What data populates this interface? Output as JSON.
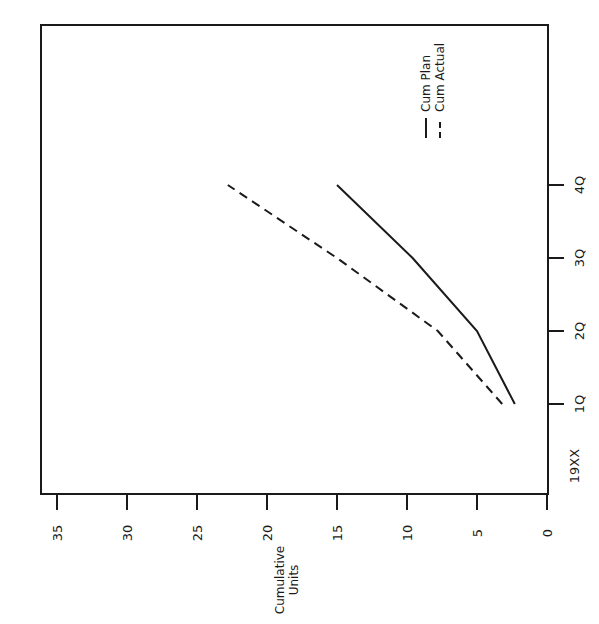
{
  "chart_data": {
    "type": "line",
    "orientation": "rotated-90-clockwise",
    "title": "",
    "xlabel": "",
    "ylabel": "Cumulative Units",
    "ylabel_lines": [
      "Cumulative",
      "Units"
    ],
    "categories": [
      "1Q",
      "2Q",
      "3Q",
      "4Q"
    ],
    "category_axis_year_label": "19XX",
    "ylim": [
      0,
      35
    ],
    "yticks": [
      0,
      5,
      10,
      15,
      20,
      25,
      30,
      35
    ],
    "ytick_labels": [
      "0",
      "5",
      "10",
      "15",
      "20",
      "25",
      "30",
      "35"
    ],
    "grid": false,
    "legend_position": "upper-right (rotated)",
    "series": [
      {
        "name": "Cum Plan",
        "style": "solid",
        "values": [
          2.3,
          5.0,
          9.6,
          15.0
        ]
      },
      {
        "name": "Cum Actual",
        "style": "dashed",
        "values": [
          3.2,
          7.8,
          15.0,
          22.8
        ]
      }
    ]
  },
  "legend": {
    "items": [
      {
        "label": "Cum Plan",
        "style": "solid"
      },
      {
        "label": "Cum Actual",
        "style": "dashed"
      }
    ]
  },
  "colors": {
    "line": "#1a1a1a",
    "background": "#ffffff"
  }
}
